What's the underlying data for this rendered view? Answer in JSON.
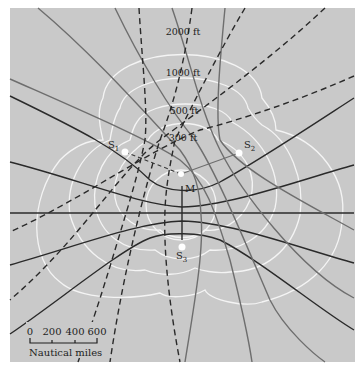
{
  "diagram": {
    "type": "hyperbolic-navigation-grid",
    "colors": {
      "background": "#c9c9c9",
      "contours": "#f4f4f4",
      "dark_lines": "#2a2a2a",
      "gray_lines": "#6e6e6e"
    },
    "stations": [
      {
        "id": "S1",
        "label": "S",
        "sub": "1",
        "x": 125,
        "y": 152
      },
      {
        "id": "S2",
        "label": "S",
        "sub": "2",
        "x": 239,
        "y": 153
      },
      {
        "id": "S3",
        "label": "S",
        "sub": "3",
        "x": 182,
        "y": 247
      }
    ],
    "master": {
      "label": "M",
      "x": 181,
      "y": 174
    },
    "contour_labels": [
      {
        "text": "2000 ft",
        "x": 183,
        "y": 32
      },
      {
        "text": "1000 ft",
        "x": 183,
        "y": 73
      },
      {
        "text": "500 ft",
        "x": 185,
        "y": 111
      },
      {
        "text": "300 ft",
        "x": 183,
        "y": 138
      }
    ],
    "scale_bar": {
      "ticks": [
        "0",
        "200",
        "400",
        "600"
      ],
      "label": "Nautical miles"
    }
  }
}
